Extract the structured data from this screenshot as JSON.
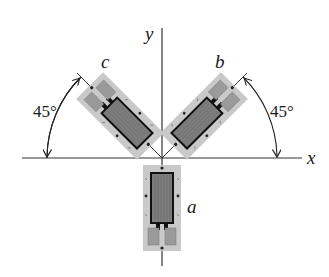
{
  "diagram": {
    "axes": {
      "x_label": "x",
      "y_label": "y",
      "origin": [
        162,
        158
      ]
    },
    "gauges": [
      {
        "id": "a",
        "label": "a",
        "angle_from_x_deg": -90
      },
      {
        "id": "b",
        "label": "b",
        "angle_from_x_deg": 45
      },
      {
        "id": "c",
        "label": "c",
        "angle_from_x_deg": 135
      }
    ],
    "angle_annotations": [
      {
        "label": "45°",
        "side": "left",
        "between": [
          "c",
          "-x"
        ]
      },
      {
        "label": "45°",
        "side": "right",
        "between": [
          "b",
          "x"
        ]
      }
    ],
    "colors": {
      "axis": "#333333",
      "backing": "#c9c9c9",
      "grid": "#7d7d7d",
      "tab": "#9a9a9a",
      "lead": "#111111"
    }
  }
}
